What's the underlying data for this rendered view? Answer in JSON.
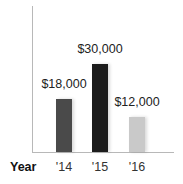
{
  "chart_data": {
    "type": "bar",
    "title": "",
    "xlabel": "Year",
    "ylabel": "",
    "categories": [
      "'14",
      "'15",
      "'16"
    ],
    "values": [
      18000,
      30000,
      12000
    ],
    "data_labels": [
      "$18,000",
      "$30,000",
      "$12,000"
    ],
    "colors": [
      "#4a4a4a",
      "#1c1c1c",
      "#c9c9c9"
    ],
    "ylim": [
      0,
      34000
    ],
    "grid": false,
    "legend": null
  },
  "axis": {
    "x_title": "Year"
  }
}
